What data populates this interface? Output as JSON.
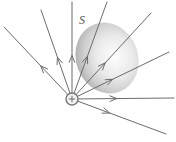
{
  "figure": {
    "name": "electric-field-lines-through-gaussian-surface",
    "background_color": "#ffffff",
    "width": 176,
    "height": 142,
    "surface_label": {
      "text": "S",
      "x": 79,
      "y": 14,
      "color": "#555555"
    },
    "charge": {
      "symbol": "+",
      "label": "positive-point-charge",
      "cx": 72,
      "cy": 99,
      "r": 6,
      "stroke_color": "#777777",
      "fill_color": "#f2f2f2"
    },
    "surface": {
      "label": "gaussian-surface-ellipse",
      "cx": 107,
      "cy": 58,
      "rx": 31,
      "ry": 36,
      "rotation": -20,
      "fill_light": "#fcfcfc",
      "fill_mid": "#d9d9d9",
      "fill_dark": "#b4b4b4"
    },
    "line_color": "#6b6b6b",
    "line_width": 1,
    "rays": [
      {
        "name": "ray-upper-left-far",
        "x2": 4,
        "y2": 27,
        "arrow_t": 0.46,
        "arrow": true
      },
      {
        "name": "ray-upper-left-mid",
        "x2": 41,
        "y2": 10,
        "arrow_t": 0.47,
        "arrow": true
      },
      {
        "name": "ray-vertical-up",
        "x2": 72,
        "y2": 2,
        "arrow_t": 0.45,
        "arrow": true
      },
      {
        "name": "ray-up-right-steep",
        "x2": 107,
        "y2": 2,
        "arrow_t": 0.44,
        "arrow": true
      },
      {
        "name": "ray-up-right-mid",
        "x2": 151,
        "y2": 13,
        "arrow_t": 0.42,
        "arrow": true
      },
      {
        "name": "ray-up-right-shallow",
        "x2": 169,
        "y2": 52,
        "arrow_t": 0.42,
        "arrow": true
      },
      {
        "name": "ray-horizontal-right",
        "x2": 174,
        "y2": 98,
        "arrow_t": 0.44,
        "arrow": true
      },
      {
        "name": "ray-down-right",
        "x2": 166,
        "y2": 134,
        "arrow_t": 0.4,
        "arrow": true
      }
    ]
  }
}
